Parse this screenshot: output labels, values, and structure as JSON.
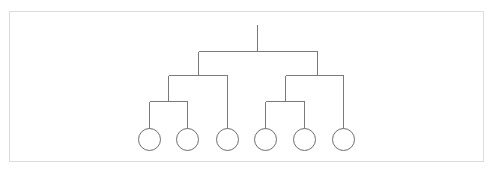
{
  "diagram": {
    "type": "tree",
    "stroke_color": "#7a7a7a",
    "frame_color": "#dcdcdc",
    "root_stub": {
      "x": 257,
      "y1": 24,
      "y2": 51
    },
    "nodes": [
      {
        "id": "root",
        "x": 257,
        "y": 51,
        "children": [
          "L",
          "R"
        ]
      },
      {
        "id": "L",
        "x": 198,
        "y": 75,
        "children": [
          "LL",
          "leaf3"
        ]
      },
      {
        "id": "R",
        "x": 317,
        "y": 75,
        "children": [
          "RL",
          "leaf6"
        ]
      },
      {
        "id": "LL",
        "x": 168,
        "y": 101,
        "children": [
          "leaf1",
          "leaf2"
        ]
      },
      {
        "id": "RL",
        "x": 285,
        "y": 101,
        "children": [
          "leaf4",
          "leaf5"
        ]
      }
    ],
    "leaves": [
      {
        "id": "leaf1",
        "cx": 149,
        "cy": 139,
        "r": 11
      },
      {
        "id": "leaf2",
        "cx": 187,
        "cy": 139,
        "r": 11
      },
      {
        "id": "leaf3",
        "cx": 227,
        "cy": 139,
        "r": 11
      },
      {
        "id": "leaf4",
        "cx": 265,
        "cy": 139,
        "r": 11
      },
      {
        "id": "leaf5",
        "cx": 304,
        "cy": 139,
        "r": 11
      },
      {
        "id": "leaf6",
        "cx": 343,
        "cy": 139,
        "r": 11
      }
    ]
  }
}
